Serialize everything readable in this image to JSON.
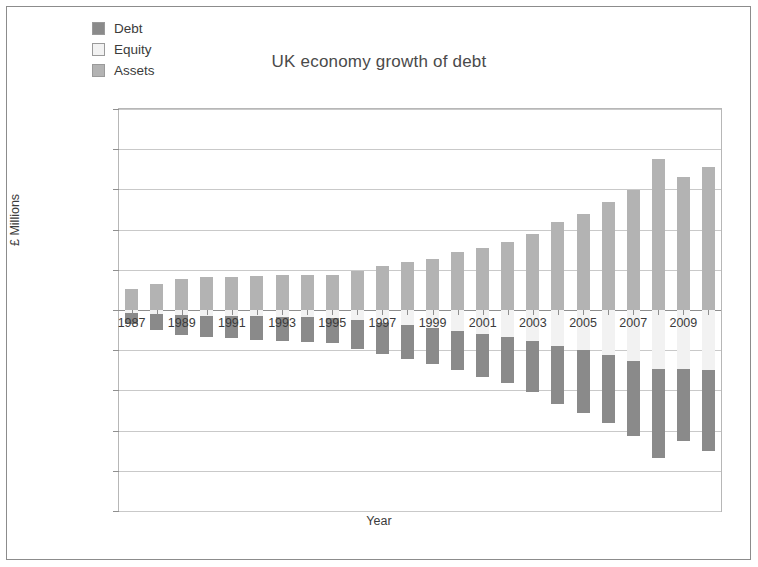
{
  "chart_data": {
    "type": "bar",
    "stacked": true,
    "title": "UK economy growth of debt",
    "xlabel": "Year",
    "ylabel": "£ Millions",
    "grid": true,
    "legend_position": "top-left",
    "ylim": [
      -25000000,
      25000000
    ],
    "ytick_labels": [
      "25,000,000",
      "20,000,000",
      "15,000,000",
      "10,000,000",
      "5,000,000",
      "0",
      "-5,000,000",
      "-10,000,000",
      "-15,000,000",
      "-20,000,000",
      "-25,000,000"
    ],
    "ytick_values": [
      25000000,
      20000000,
      15000000,
      10000000,
      5000000,
      0,
      -5000000,
      -10000000,
      -15000000,
      -20000000,
      -25000000
    ],
    "categories": [
      "1987",
      "1988",
      "1989",
      "1990",
      "1991",
      "1992",
      "1993",
      "1994",
      "1995",
      "1996",
      "1997",
      "1998",
      "1999",
      "2000",
      "2001",
      "2002",
      "2003",
      "2004",
      "2005",
      "2006",
      "2007",
      "2008",
      "2009",
      "2010"
    ],
    "xtick_labels_shown": [
      "1987",
      "1989",
      "1991",
      "1993",
      "1995",
      "1997",
      "1999",
      "2001",
      "2003",
      "2005",
      "2007",
      "2009"
    ],
    "series": [
      {
        "name": "Assets",
        "color": "#b3b3b3",
        "values": [
          2600000,
          3200000,
          3800000,
          4100000,
          4100000,
          4200000,
          4300000,
          4400000,
          4400000,
          4900000,
          5500000,
          6000000,
          6400000,
          7200000,
          7700000,
          8500000,
          9400000,
          11000000,
          12000000,
          13400000,
          14900000,
          18800000,
          16500000,
          17800000
        ]
      },
      {
        "name": "Equity",
        "color": "#f2f2f2",
        "values": [
          -400000,
          -500000,
          -600000,
          -700000,
          -700000,
          -800000,
          -900000,
          -900000,
          -1000000,
          -1300000,
          -1600000,
          -1900000,
          -2200000,
          -2600000,
          -3000000,
          -3400000,
          -3900000,
          -4500000,
          -5000000,
          -5600000,
          -6300000,
          -7400000,
          -7300000,
          -7500000
        ]
      },
      {
        "name": "Debt",
        "color": "#8a8a8a",
        "values": [
          -1400000,
          -2000000,
          -2500000,
          -2700000,
          -2800000,
          -2900000,
          -3000000,
          -3100000,
          -3100000,
          -3500000,
          -3900000,
          -4200000,
          -4500000,
          -4900000,
          -5300000,
          -5700000,
          -6300000,
          -7200000,
          -7800000,
          -8500000,
          -9400000,
          -11000000,
          -9000000,
          -10000000
        ]
      }
    ]
  },
  "legend": {
    "items": [
      {
        "label": "Debt",
        "swatch": "#8a8a8a"
      },
      {
        "label": "Equity",
        "swatch": "#f2f2f2"
      },
      {
        "label": "Assets",
        "swatch": "#b3b3b3"
      }
    ]
  }
}
